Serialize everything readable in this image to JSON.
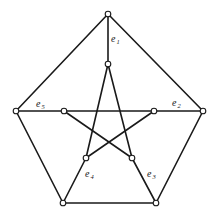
{
  "diagram": {
    "vertices": [
      {
        "id": "o1",
        "x": 108,
        "y": 14
      },
      {
        "id": "o2",
        "x": 203,
        "y": 111
      },
      {
        "id": "o3",
        "x": 156,
        "y": 203
      },
      {
        "id": "o4",
        "x": 63,
        "y": 203
      },
      {
        "id": "o5",
        "x": 16,
        "y": 111
      },
      {
        "id": "i1",
        "x": 108,
        "y": 64
      },
      {
        "id": "i2",
        "x": 154,
        "y": 111
      },
      {
        "id": "i3",
        "x": 132,
        "y": 158
      },
      {
        "id": "i4",
        "x": 86,
        "y": 158
      },
      {
        "id": "i5",
        "x": 64,
        "y": 111
      }
    ],
    "edges": [
      [
        "o1",
        "o2"
      ],
      [
        "o2",
        "o3"
      ],
      [
        "o3",
        "o4"
      ],
      [
        "o4",
        "o5"
      ],
      [
        "o5",
        "o1"
      ],
      [
        "o1",
        "i1"
      ],
      [
        "o2",
        "i2"
      ],
      [
        "o3",
        "i3"
      ],
      [
        "o4",
        "i4"
      ],
      [
        "o5",
        "i5"
      ],
      [
        "i1",
        "i3"
      ],
      [
        "i3",
        "i5"
      ],
      [
        "i5",
        "i2"
      ],
      [
        "i2",
        "i4"
      ],
      [
        "i4",
        "i1"
      ]
    ],
    "labels": [
      {
        "base": "e",
        "sub": "1",
        "x": 111,
        "y": 42
      },
      {
        "base": "e",
        "sub": "2",
        "x": 172,
        "y": 106
      },
      {
        "base": "e",
        "sub": "3",
        "x": 147,
        "y": 177
      },
      {
        "base": "e",
        "sub": "4",
        "x": 85,
        "y": 177
      },
      {
        "base": "e",
        "sub": "5",
        "x": 36,
        "y": 107
      }
    ]
  }
}
